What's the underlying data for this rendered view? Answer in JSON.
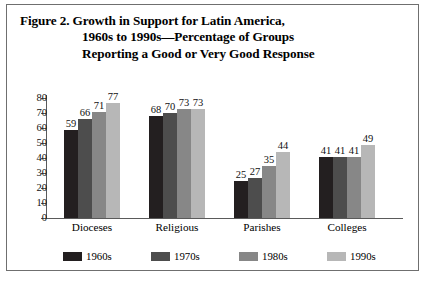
{
  "figure": {
    "title_lines": [
      "Figure 2.  Growth in Support for Latin America,",
      "1960s to 1990s—Percentage of Groups",
      "Reporting a Good or Very Good Response"
    ]
  },
  "chart_data": {
    "type": "bar",
    "title": "Figure 2. Growth in Support for Latin America, 1960s to 1990s—Percentage of Groups Reporting a Good or Very Good Response",
    "xlabel": "",
    "ylabel": "",
    "ylim": [
      0,
      80
    ],
    "yticks": [
      0,
      10,
      20,
      30,
      40,
      50,
      60,
      70,
      80
    ],
    "ytick_labels": [
      "0",
      "10",
      "20",
      "30",
      "40",
      "50",
      "60",
      "70",
      "80"
    ],
    "grid": false,
    "legend_position": "bottom",
    "categories": [
      "Dioceses",
      "Religious",
      "Parishes",
      "Colleges"
    ],
    "series": [
      {
        "name": "1960s",
        "color": "#231f20",
        "values": [
          59,
          68,
          25,
          41
        ]
      },
      {
        "name": "1970s",
        "color": "#4d4d4d",
        "values": [
          66,
          70,
          27,
          41
        ]
      },
      {
        "name": "1980s",
        "color": "#878787",
        "values": [
          71,
          73,
          35,
          41
        ]
      },
      {
        "name": "1990s",
        "color": "#b7b7b7",
        "values": [
          77,
          73,
          44,
          49
        ]
      }
    ]
  }
}
